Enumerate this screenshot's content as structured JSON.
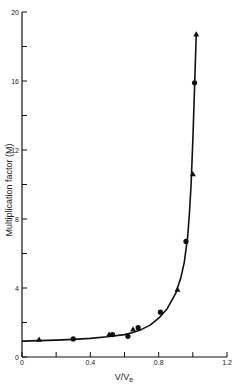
{
  "chart_data": {
    "type": "line",
    "title": "",
    "xlabel": "V/V",
    "xlabel_subscript": "e",
    "ylabel": "Multiplication factor  (M)",
    "xlim": [
      0,
      1.2
    ],
    "ylim": [
      0,
      20
    ],
    "x_ticks": [
      0,
      0.2,
      0.4,
      0.6,
      0.8,
      1.0,
      1.2
    ],
    "x_tick_labels": [
      "0",
      "",
      "0.4",
      "",
      "0.8",
      "",
      "1.2"
    ],
    "y_ticks": [
      0,
      2,
      4,
      6,
      8,
      10,
      12,
      14,
      16,
      18,
      20
    ],
    "y_tick_labels": [
      "0",
      "",
      "4",
      "",
      "8",
      "",
      "12",
      "",
      "16",
      "",
      "20"
    ],
    "grid": false,
    "legend": null,
    "series": [
      {
        "name": "circles",
        "marker": "circle",
        "x": [
          0.3,
          0.53,
          0.62,
          0.68,
          0.81,
          0.96,
          1.01
        ],
        "y": [
          1.05,
          1.3,
          1.2,
          1.7,
          2.6,
          6.7,
          15.9
        ]
      },
      {
        "name": "triangles",
        "marker": "triangle",
        "x": [
          0.1,
          0.51,
          0.65,
          0.91,
          1.0,
          1.02
        ],
        "y": [
          1.0,
          1.3,
          1.6,
          3.9,
          10.6,
          18.7
        ]
      },
      {
        "name": "fit curve",
        "marker": "none",
        "x": [
          0.0,
          0.1,
          0.2,
          0.3,
          0.4,
          0.5,
          0.6,
          0.65,
          0.7,
          0.75,
          0.8,
          0.85,
          0.9,
          0.93,
          0.95,
          0.97,
          0.98,
          0.99,
          1.0,
          1.01,
          1.02
        ],
        "y": [
          0.92,
          0.95,
          0.98,
          1.02,
          1.08,
          1.17,
          1.3,
          1.42,
          1.6,
          1.85,
          2.25,
          2.8,
          3.7,
          4.6,
          5.5,
          7.0,
          8.3,
          10.0,
          12.5,
          15.5,
          18.8
        ]
      }
    ]
  }
}
